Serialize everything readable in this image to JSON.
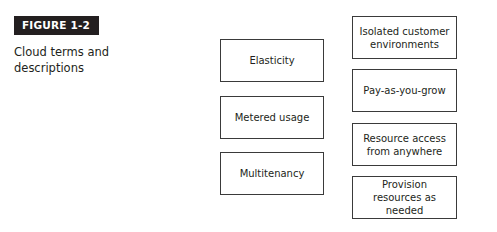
{
  "figure": {
    "label": "FIGURE 1-2",
    "caption": "Cloud terms and descriptions"
  },
  "terms": [
    {
      "label": "Elasticity"
    },
    {
      "label": "Metered usage"
    },
    {
      "label": "Multitenancy"
    }
  ],
  "descriptions": [
    {
      "label": "Isolated customer environments"
    },
    {
      "label": "Pay-as-you-grow"
    },
    {
      "label": "Resource access from anywhere"
    },
    {
      "label": "Provision resources as needed"
    }
  ]
}
